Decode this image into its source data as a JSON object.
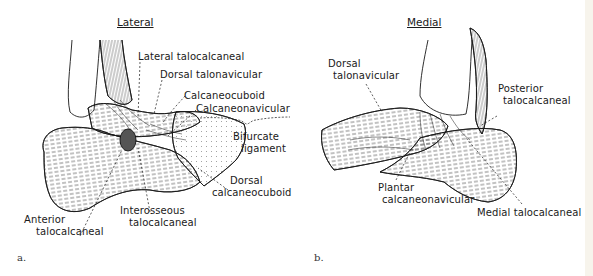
{
  "figure": {
    "panels": [
      {
        "letter": "a.",
        "title": "Lateral",
        "labels": {
          "lateral_talocalcaneal": "Lateral talocalcaneal",
          "dorsal_talonavicular": "Dorsal talonavicular",
          "calcaneocuboid": "Calcaneocuboid",
          "calcaneonavicular": "Calcaneonavicular",
          "bifurcate_1": "Bifurcate",
          "bifurcate_2": "ligament",
          "dorsal_calcaneocuboid_1": "Dorsal",
          "dorsal_calcaneocuboid_2": "calcaneocuboid",
          "interosseous_1": "Interosseous",
          "interosseous_2": "talocalcaneal",
          "anterior_1": "Anterior",
          "anterior_2": "talocalcaneal"
        }
      },
      {
        "letter": "b.",
        "title": "Medial",
        "labels": {
          "dorsal_talonavicular_1": "Dorsal",
          "dorsal_talonavicular_2": "talonavicular",
          "posterior_1": "Posterior",
          "posterior_2": "talocalcaneal",
          "plantar_1": "Plantar",
          "plantar_2": "calcaneonavicular",
          "medial_talocalcaneal": "Medial talocalcaneal"
        }
      }
    ]
  },
  "colors": {
    "ink": "#1a1a1a",
    "background": "#ffffff"
  }
}
